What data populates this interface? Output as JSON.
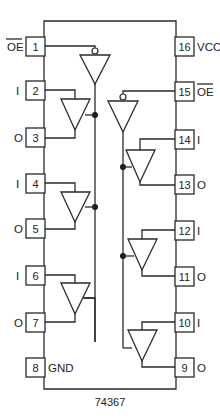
{
  "chip_label": "74367",
  "pins_left": [
    {
      "num": "1",
      "label": "OE",
      "overline": true
    },
    {
      "num": "2",
      "label": "I"
    },
    {
      "num": "3",
      "label": "O"
    },
    {
      "num": "4",
      "label": "I"
    },
    {
      "num": "5",
      "label": "O"
    },
    {
      "num": "6",
      "label": "I"
    },
    {
      "num": "7",
      "label": "O"
    },
    {
      "num": "8",
      "label": "GND"
    }
  ],
  "pins_right": [
    {
      "num": "16",
      "label": "VCC"
    },
    {
      "num": "15",
      "label": "OE",
      "overline": true
    },
    {
      "num": "14",
      "label": "I"
    },
    {
      "num": "13",
      "label": "O"
    },
    {
      "num": "12",
      "label": "I"
    },
    {
      "num": "11",
      "label": "O"
    },
    {
      "num": "10",
      "label": "I"
    },
    {
      "num": "9",
      "label": "O"
    }
  ],
  "colors": {
    "line": "#2a2a2a",
    "background": "#ffffff"
  }
}
